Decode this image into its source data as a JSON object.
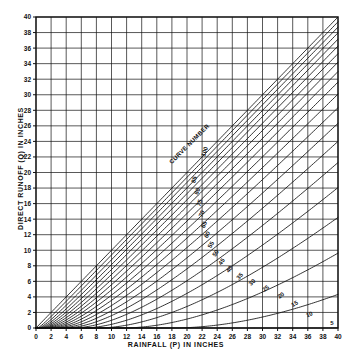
{
  "chart_data": {
    "type": "line",
    "title": "",
    "xlabel": "RAINFALL (P) IN INCHES",
    "ylabel": "DIRECT RUNOFF (Q) IN INCHES",
    "xlim": [
      0,
      40
    ],
    "ylim": [
      0,
      40
    ],
    "xticks": [
      0,
      2,
      4,
      6,
      8,
      10,
      12,
      14,
      16,
      18,
      20,
      22,
      24,
      26,
      28,
      30,
      32,
      34,
      36,
      38,
      40
    ],
    "yticks": [
      0,
      2,
      4,
      6,
      8,
      10,
      12,
      14,
      16,
      18,
      20,
      22,
      24,
      26,
      28,
      30,
      32,
      34,
      36,
      38,
      40
    ],
    "xtick_labels": [
      "0",
      "2",
      "4",
      "6",
      "8",
      "10",
      "12",
      "14",
      "16",
      "18",
      "20",
      "22",
      "24",
      "26",
      "28",
      "30",
      "32",
      "34",
      "36",
      "38",
      "40"
    ],
    "ytick_labels": [
      "0",
      "2",
      "4",
      "6",
      "8",
      "10",
      "12",
      "14",
      "16",
      "18",
      "20",
      "22",
      "24",
      "26",
      "28",
      "30",
      "32",
      "34",
      "36",
      "38",
      "40"
    ],
    "grid": true,
    "grid_color": "#111111",
    "line_color": "#111111",
    "background": "#ffffff",
    "legend_position": "inline-curve-labels",
    "annotations": [
      {
        "text": "CURVE NUMBER",
        "x": 20.5,
        "y": 23.5,
        "rotation": -45
      }
    ],
    "curve_parameter_name": "Curve Number (CN)",
    "hatch_start_x": 8,
    "series": [
      {
        "name": "100",
        "label": "100",
        "cn": 100,
        "label_x": 22.6,
        "label_y": 22.6,
        "label_rot": -72
      },
      {
        "name": "95",
        "label": "",
        "cn": 95
      },
      {
        "name": "90",
        "label": "",
        "cn": 90
      },
      {
        "name": "85",
        "label": "85",
        "cn": 85,
        "label_x": 21.2,
        "label_y": 19.0,
        "label_rot": -72
      },
      {
        "name": "80",
        "label": "80",
        "cn": 80,
        "label_x": 21.6,
        "label_y": 17.5,
        "label_rot": -72
      },
      {
        "name": "75",
        "label": "75",
        "cn": 75,
        "label_x": 21.9,
        "label_y": 16.0,
        "label_rot": -70
      },
      {
        "name": "70",
        "label": "70",
        "cn": 70,
        "label_x": 22.2,
        "label_y": 14.6,
        "label_rot": -68
      },
      {
        "name": "65",
        "label": "65",
        "cn": 65,
        "label_x": 22.5,
        "label_y": 13.2,
        "label_rot": -66
      },
      {
        "name": "60",
        "label": "60",
        "cn": 60,
        "label_x": 22.9,
        "label_y": 11.9,
        "label_rot": -64
      },
      {
        "name": "55",
        "label": "55",
        "cn": 55,
        "label_x": 23.4,
        "label_y": 10.6,
        "label_rot": -62
      },
      {
        "name": "50",
        "label": "50",
        "cn": 50,
        "label_x": 24.0,
        "label_y": 9.5,
        "label_rot": -58
      },
      {
        "name": "45",
        "label": "45",
        "cn": 45,
        "label_x": 24.8,
        "label_y": 8.4,
        "label_rot": -55
      },
      {
        "name": "40",
        "label": "40",
        "cn": 40,
        "label_x": 25.8,
        "label_y": 7.4,
        "label_rot": -52
      },
      {
        "name": "35",
        "label": "35",
        "cn": 35,
        "label_x": 27.2,
        "label_y": 6.5,
        "label_rot": -48
      },
      {
        "name": "30",
        "label": "30",
        "cn": 30,
        "label_x": 28.8,
        "label_y": 5.7,
        "label_rot": -44
      },
      {
        "name": "25",
        "label": "25",
        "cn": 25,
        "label_x": 30.6,
        "label_y": 4.9,
        "label_rot": -40
      },
      {
        "name": "20",
        "label": "20",
        "cn": 20,
        "label_x": 32.6,
        "label_y": 4.0,
        "label_rot": -36
      },
      {
        "name": "15",
        "label": "15",
        "cn": 15,
        "label_x": 34.4,
        "label_y": 2.9,
        "label_rot": -32
      },
      {
        "name": "10",
        "label": "10",
        "cn": 10,
        "label_x": 36.3,
        "label_y": 1.5,
        "label_rot": -22
      },
      {
        "name": "5",
        "label": "5",
        "cn": 5,
        "label_x": 39.2,
        "label_y": 0.45,
        "label_rot": 0
      }
    ]
  },
  "axis": {
    "x_title": "RAINFALL (P) IN INCHES",
    "y_title": "DIRECT RUNOFF (Q) IN INCHES"
  },
  "annotation": {
    "curve_number_text": "CURVE NUMBER"
  }
}
